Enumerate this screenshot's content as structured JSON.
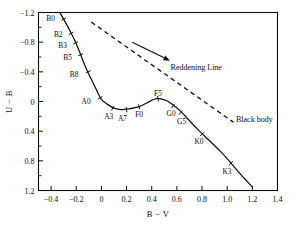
{
  "chart_data": {
    "type": "line",
    "title": "",
    "xlabel": "B − V",
    "ylabel": "U − B",
    "xlim": [
      -0.5,
      1.4
    ],
    "ylim": [
      1.2,
      -1.2
    ],
    "y_inverted": true,
    "grid": false,
    "legend_position": "inline-annotations",
    "xticks": [
      -0.4,
      -0.2,
      0,
      0.2,
      0.4,
      0.6,
      0.8,
      1.0,
      1.2,
      1.4
    ],
    "xtick_labels": [
      "−0.4",
      "−0.2",
      "0",
      "0.2",
      "0.4",
      "0.6",
      "0.8",
      "1.0",
      "1.2",
      "1.4"
    ],
    "yticks": [
      -1.2,
      -0.8,
      -0.4,
      0,
      0.4,
      0.8,
      1.2
    ],
    "ytick_labels": [
      "−1.2",
      "−0.8",
      "−0.4",
      "0",
      "0.4",
      "0.8",
      "1.2"
    ],
    "y_minor_ticks": [
      -1.0,
      -0.6,
      -0.2,
      0.2,
      0.6,
      1.0
    ],
    "series": [
      {
        "name": "Main sequence",
        "style": "solid",
        "points": [
          {
            "x": -0.33,
            "y": -1.2
          },
          {
            "x": -0.3,
            "y": -1.11
          },
          {
            "x": -0.24,
            "y": -0.92
          },
          {
            "x": -0.2,
            "y": -0.78
          },
          {
            "x": -0.16,
            "y": -0.61
          },
          {
            "x": -0.12,
            "y": -0.44
          },
          {
            "x": -0.08,
            "y": -0.3
          },
          {
            "x": -0.04,
            "y": -0.16
          },
          {
            "x": 0.0,
            "y": -0.03
          },
          {
            "x": 0.05,
            "y": 0.04
          },
          {
            "x": 0.1,
            "y": 0.09
          },
          {
            "x": 0.16,
            "y": 0.11
          },
          {
            "x": 0.22,
            "y": 0.1
          },
          {
            "x": 0.3,
            "y": 0.07
          },
          {
            "x": 0.36,
            "y": 0.02
          },
          {
            "x": 0.42,
            "y": -0.03
          },
          {
            "x": 0.46,
            "y": -0.04
          },
          {
            "x": 0.52,
            "y": -0.01
          },
          {
            "x": 0.58,
            "y": 0.06
          },
          {
            "x": 0.63,
            "y": 0.13
          },
          {
            "x": 0.7,
            "y": 0.26
          },
          {
            "x": 0.78,
            "y": 0.4
          },
          {
            "x": 0.86,
            "y": 0.53
          },
          {
            "x": 0.95,
            "y": 0.68
          },
          {
            "x": 1.02,
            "y": 0.81
          },
          {
            "x": 1.1,
            "y": 0.97
          },
          {
            "x": 1.16,
            "y": 1.08
          },
          {
            "x": 1.2,
            "y": 1.15
          }
        ]
      },
      {
        "name": "Black body",
        "style": "dashed",
        "points": [
          {
            "x": -0.08,
            "y": -1.07
          },
          {
            "x": 1.05,
            "y": 0.28
          }
        ]
      }
    ],
    "spectral_markers": [
      {
        "label": "B0",
        "x": -0.3,
        "y": -1.11,
        "label_dx": -13,
        "label_dy": 2
      },
      {
        "label": "B2",
        "x": -0.24,
        "y": -0.92,
        "label_dx": -13,
        "label_dy": 4
      },
      {
        "label": "B3",
        "x": -0.205,
        "y": -0.79,
        "label_dx": -13,
        "label_dy": 5
      },
      {
        "label": "B5",
        "x": -0.165,
        "y": -0.63,
        "label_dx": -13,
        "label_dy": 5
      },
      {
        "label": "B8",
        "x": -0.105,
        "y": -0.4,
        "label_dx": -14,
        "label_dy": 5
      },
      {
        "label": "A0",
        "x": -0.01,
        "y": -0.05,
        "label_dx": -14,
        "label_dy": 6
      },
      {
        "label": "A3",
        "x": 0.09,
        "y": 0.09,
        "label_dx": -4,
        "label_dy": 11
      },
      {
        "label": "A7",
        "x": 0.2,
        "y": 0.11,
        "label_dx": -4,
        "label_dy": 11
      },
      {
        "label": "F0",
        "x": 0.3,
        "y": 0.07,
        "label_dx": 0,
        "label_dy": 10
      },
      {
        "label": "F5",
        "x": 0.45,
        "y": -0.04,
        "label_dx": 0,
        "label_dy": -3
      },
      {
        "label": "G0",
        "x": 0.57,
        "y": 0.06,
        "label_dx": -2,
        "label_dy": 10
      },
      {
        "label": "G5",
        "x": 0.63,
        "y": 0.15,
        "label_dx": 1,
        "label_dy": 11
      },
      {
        "label": "K0",
        "x": 0.8,
        "y": 0.44,
        "label_dx": -3,
        "label_dy": 10
      },
      {
        "label": "K3",
        "x": 1.03,
        "y": 0.83,
        "label_dx": -4,
        "label_dy": 11
      }
    ],
    "annotations": [
      {
        "name": "reddening-line",
        "text": "Reddening Line",
        "x": 0.55,
        "y": -0.47
      },
      {
        "name": "black-body",
        "text": "Black body",
        "x": 1.07,
        "y": 0.23
      }
    ],
    "reddening_arrow": {
      "x1": 0.245,
      "y1": -0.8,
      "x2": 0.545,
      "y2": -0.55
    }
  }
}
